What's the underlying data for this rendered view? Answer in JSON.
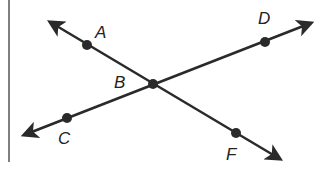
{
  "diagram": {
    "colors": {
      "line": "#2a2a2a",
      "background": "#ffffff"
    },
    "points": [
      {
        "label": "A",
        "x": 87,
        "y": 45,
        "label_x": 95,
        "label_y": 24
      },
      {
        "label": "B",
        "x": 153,
        "y": 84,
        "label_x": 114,
        "label_y": 74
      },
      {
        "label": "C",
        "x": 67,
        "y": 118,
        "label_x": 58,
        "label_y": 130
      },
      {
        "label": "D",
        "x": 265,
        "y": 42,
        "label_x": 258,
        "label_y": 10
      },
      {
        "label": "F",
        "x": 236,
        "y": 133,
        "label_x": 226,
        "label_y": 146
      }
    ],
    "lines": [
      {
        "name": "line-AF",
        "from": [
          50,
          22
        ],
        "to": [
          280,
          159
        ]
      },
      {
        "name": "line-CD",
        "from": [
          24,
          135
        ],
        "to": [
          311,
          23
        ]
      }
    ],
    "border_line": {
      "x": 9,
      "y1": 0,
      "y2": 162
    }
  }
}
